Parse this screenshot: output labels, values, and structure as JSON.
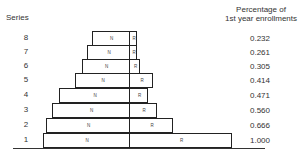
{
  "header": {
    "series_label": "Series",
    "pct_label_line1": "Percentage of",
    "pct_label_line2": "1st year enrollments"
  },
  "segment_labels": {
    "left": "N",
    "right": "R"
  },
  "rows": [
    {
      "series": "8",
      "pct": "0.232",
      "left": 92,
      "right": 137,
      "top": 31
    },
    {
      "series": "7",
      "pct": "0.261",
      "left": 87,
      "right": 137,
      "top": 45
    },
    {
      "series": "6",
      "pct": "0.305",
      "left": 82,
      "right": 140,
      "top": 59
    },
    {
      "series": "5",
      "pct": "0.414",
      "left": 75,
      "right": 153,
      "top": 73
    },
    {
      "series": "4",
      "pct": "0.471",
      "left": 59,
      "right": 148,
      "top": 88
    },
    {
      "series": "3",
      "pct": "0.560",
      "left": 52,
      "right": 157,
      "top": 103
    },
    {
      "series": "2",
      "pct": "0.666",
      "left": 46,
      "right": 173,
      "top": 118
    },
    {
      "series": "1",
      "pct": "1.000",
      "left": 43,
      "right": 232,
      "top": 133
    }
  ],
  "chart_data": {
    "type": "bar",
    "xlabel": "",
    "ylabel": "Series",
    "categories": [
      "1",
      "2",
      "3",
      "4",
      "5",
      "6",
      "7",
      "8"
    ],
    "series": [
      {
        "name": "Percentage of 1st year enrollments",
        "values": [
          1.0,
          0.666,
          0.56,
          0.471,
          0.414,
          0.305,
          0.261,
          0.232
        ]
      }
    ],
    "segment_labels": [
      "N",
      "R"
    ]
  }
}
